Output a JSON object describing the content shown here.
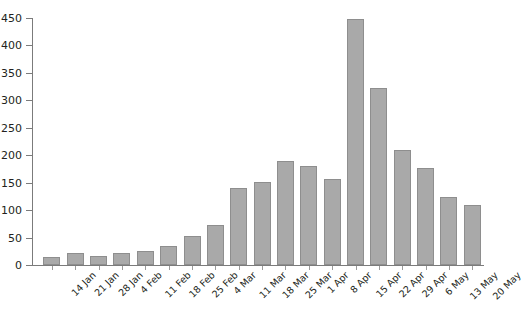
{
  "chart_data": {
    "type": "bar",
    "title": "",
    "xlabel": "",
    "ylabel": "",
    "ylim": [
      0,
      450
    ],
    "yticks": [
      0,
      50,
      100,
      150,
      200,
      250,
      300,
      350,
      400,
      450
    ],
    "grid": false,
    "legend": null,
    "bar_color": "#a9a9a9",
    "bar_border_color": "#8e8e8e",
    "axis_color": "#7b7b7b",
    "text_color": "#231f20",
    "categories": [
      "14 Jan",
      "21 Jan",
      "28 Jan",
      "4 Feb",
      "11 Feb",
      "18 Feb",
      "25 Feb",
      "4 Mar",
      "11 Mar",
      "18 Mar",
      "25 Mar",
      "1 Apr",
      "8 Apr",
      "15 Apr",
      "22 Apr",
      "29 Apr",
      "6 May",
      "13 May",
      "20 May"
    ],
    "values": [
      15,
      21,
      16,
      21,
      26,
      35,
      53,
      72,
      140,
      152,
      190,
      180,
      157,
      448,
      322,
      210,
      177,
      124,
      110
    ]
  }
}
